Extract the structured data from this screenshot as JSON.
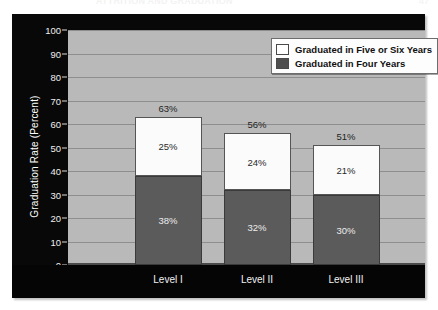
{
  "page": {
    "running_head": "ATTRITION AND GRADUATION",
    "folio": "47"
  },
  "legend": {
    "items": [
      {
        "label": "Graduated in Five or Six Years",
        "swatch": "white",
        "color": "#ffffff"
      },
      {
        "label": "Graduated in Four Years",
        "swatch": "dark",
        "color": "#5b5b5b"
      }
    ]
  },
  "axes": {
    "ylabel": "Graduation Rate (Percent)",
    "yticks": [
      "0",
      "10",
      "20",
      "30",
      "40",
      "50",
      "60",
      "70",
      "80",
      "90",
      "100"
    ],
    "xticks": [
      "Level I",
      "Level II",
      "Level III"
    ]
  },
  "chart_data": {
    "type": "bar",
    "stacked": true,
    "title": "",
    "xlabel": "",
    "ylabel": "Graduation Rate (Percent)",
    "ylim": [
      0,
      100
    ],
    "ytick_step": 10,
    "grid": true,
    "legend_position": "top-right",
    "categories": [
      "Level I",
      "Level II",
      "Level III"
    ],
    "series": [
      {
        "name": "Graduated in Four Years",
        "color": "#5b5b5b",
        "values": [
          38,
          32,
          30
        ]
      },
      {
        "name": "Graduated in Five or Six Years",
        "color": "#ffffff",
        "values": [
          25,
          24,
          21
        ]
      }
    ],
    "totals": [
      63,
      56,
      51
    ],
    "data_labels": {
      "Level I": {
        "four": "38%",
        "five_or_six": "25%",
        "total": "63%"
      },
      "Level II": {
        "four": "32%",
        "five_or_six": "24%",
        "total": "56%"
      },
      "Level III": {
        "four": "30%",
        "five_or_six": "21%",
        "total": "51%"
      }
    },
    "bar_labels": [
      {
        "category": "Level I",
        "four": "38%",
        "five_or_six": "25%",
        "total": "63%"
      },
      {
        "category": "Level II",
        "four": "32%",
        "five_or_six": "24%",
        "total": "56%"
      },
      {
        "category": "Level III",
        "four": "30%",
        "five_or_six": "21%",
        "total": "51%"
      }
    ]
  }
}
